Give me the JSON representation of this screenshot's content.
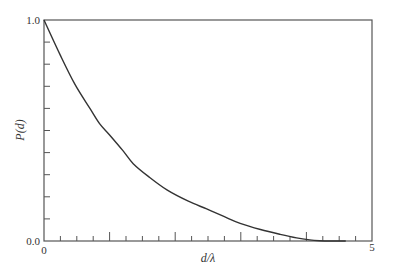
{
  "chart_data": {
    "type": "line",
    "title": "",
    "xlabel": "d/λ",
    "ylabel": "P(d)",
    "xlim": [
      0,
      5
    ],
    "ylim": [
      0.0,
      1.0
    ],
    "x_tick_labels": [
      "0",
      "5"
    ],
    "y_tick_labels": [
      "0.0",
      "1.0"
    ],
    "x_minor_tick_step": 0.25,
    "x_major_tick_step": 1,
    "y_minor_tick_step": 0.1,
    "grid": false,
    "legend": null,
    "series": [
      {
        "name": "P(d)",
        "color": "#333333",
        "x": [
          0,
          0.25,
          0.47,
          0.7,
          0.85,
          1.0,
          1.2,
          1.36,
          1.6,
          1.88,
          2.2,
          2.48,
          2.75,
          2.99,
          3.3,
          3.6,
          3.85,
          4.05,
          4.2,
          4.3
        ],
        "y": [
          1.0,
          0.84,
          0.71,
          0.6,
          0.53,
          0.48,
          0.41,
          0.35,
          0.29,
          0.23,
          0.18,
          0.145,
          0.11,
          0.08,
          0.052,
          0.03,
          0.014,
          0.005,
          0.001,
          0.0
        ]
      }
    ]
  },
  "plot_box": {
    "left": 44,
    "top": 20,
    "right": 372,
    "bottom": 241
  }
}
